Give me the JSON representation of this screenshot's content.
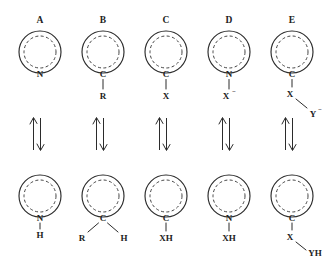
{
  "figure": {
    "kind": "chemical-equilibrium-scheme",
    "ring_icon": "aromatic-ring-icon",
    "arrow_icon": "equilibrium-arrow-icon",
    "ink_color": "#2b2b2b",
    "background_color": "#ffffff"
  },
  "panels": [
    {
      "letter": "A",
      "top": {
        "ring_atom": "N",
        "substituents": []
      },
      "bottom": {
        "ring_atom": "N",
        "substituents": [
          {
            "label": "H",
            "position": "below"
          }
        ]
      }
    },
    {
      "letter": "B",
      "top": {
        "ring_atom": "C",
        "substituents": [
          {
            "label": "R",
            "position": "below"
          }
        ]
      },
      "bottom": {
        "ring_atom": "C",
        "substituents": [
          {
            "label": "R",
            "position": "lower-left"
          },
          {
            "label": "H",
            "position": "lower-right"
          }
        ]
      }
    },
    {
      "letter": "C",
      "top": {
        "ring_atom": "C",
        "substituents": [
          {
            "label": "X",
            "position": "below"
          }
        ]
      },
      "bottom": {
        "ring_atom": "C",
        "substituents": [
          {
            "label": "XH",
            "position": "below"
          }
        ]
      }
    },
    {
      "letter": "D",
      "top": {
        "ring_atom": "N",
        "substituents": [
          {
            "label": "X",
            "charge": "−",
            "position": "below"
          }
        ]
      },
      "bottom": {
        "ring_atom": "N",
        "substituents": [
          {
            "label": "XH",
            "position": "below"
          }
        ]
      }
    },
    {
      "letter": "E",
      "top": {
        "ring_atom": "C",
        "substituents": [
          {
            "label": "X",
            "position": "below"
          },
          {
            "label": "Y",
            "charge": "−",
            "position": "lower-right"
          }
        ]
      },
      "bottom": {
        "ring_atom": "C",
        "substituents": [
          {
            "label": "X",
            "position": "below"
          },
          {
            "label": "YH",
            "position": "lower-right"
          }
        ]
      }
    }
  ]
}
